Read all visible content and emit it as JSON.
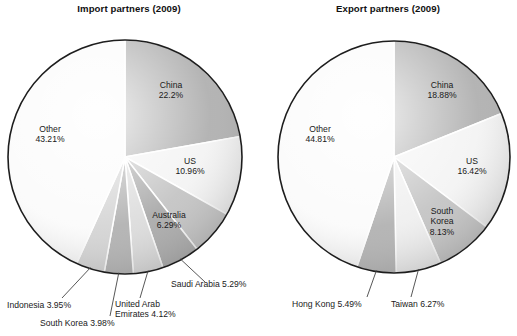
{
  "charts": [
    {
      "title": "Import partners (2009)",
      "center": {
        "x": 125,
        "y": 157
      },
      "radius": 117
    },
    {
      "title": "Export partners (2009)",
      "center": {
        "x": 135,
        "y": 157
      },
      "radius": 116
    }
  ],
  "chart_data": [
    {
      "type": "pie",
      "title": "Import partners (2009)",
      "xlabel": "",
      "ylabel": "",
      "legend": "none",
      "grid": false,
      "start_angle_deg": 0,
      "direction": "clockwise",
      "categories": [
        "China",
        "US",
        "Australia",
        "Saudi Arabia",
        "United Arab Emirates",
        "South Korea",
        "Indonesia",
        "Other"
      ],
      "values": [
        22.2,
        10.96,
        6.29,
        5.29,
        4.12,
        3.98,
        3.95,
        43.21
      ],
      "value_labels": [
        "22.2%",
        "10.96%",
        "6.29%",
        "5.29%",
        "4.12%",
        "3.98%",
        "3.95%",
        "43.21%"
      ],
      "slice_colors": [
        "#a6a6a6",
        "#f2f2f2",
        "#bdbdbd",
        "#a0a0a0",
        "#d8d8d8",
        "#a8a8a8",
        "#cfcfcf",
        "#fafafa"
      ],
      "labels_inside": [
        {
          "name": "China",
          "text": "China\n22.2%"
        },
        {
          "name": "US",
          "text": "US\n10.96%"
        },
        {
          "name": "Australia",
          "text": "Australia\n6.29%"
        },
        {
          "name": "Other",
          "text": "Other\n43.21%"
        }
      ],
      "labels_outside": [
        {
          "name": "Saudi Arabia",
          "text": "Saudi Arabia 5.29%"
        },
        {
          "name": "United Arab Emirates",
          "text": "United Arab\nEmirates 4.12%"
        },
        {
          "name": "South Korea",
          "text": "South Korea 3.98%"
        },
        {
          "name": "Indonesia",
          "text": "Indonesia 3.95%"
        }
      ]
    },
    {
      "type": "pie",
      "title": "Export partners (2009)",
      "xlabel": "",
      "ylabel": "",
      "legend": "none",
      "grid": false,
      "start_angle_deg": 0,
      "direction": "clockwise",
      "categories": [
        "China",
        "US",
        "South Korea",
        "Taiwan",
        "Hong Kong",
        "Other"
      ],
      "values": [
        18.88,
        16.42,
        8.13,
        6.27,
        5.49,
        44.81
      ],
      "value_labels": [
        "18.88%",
        "16.42%",
        "8.13%",
        "6.27%",
        "5.49%",
        "44.81%"
      ],
      "slice_colors": [
        "#a6a6a6",
        "#f2f2f2",
        "#bdbdbd",
        "#ededed",
        "#a8a8a8",
        "#fafafa"
      ],
      "labels_inside": [
        {
          "name": "China",
          "text": "China\n18.88%"
        },
        {
          "name": "US",
          "text": "US\n16.42%"
        },
        {
          "name": "South Korea",
          "text": "South\nKorea\n8.13%"
        },
        {
          "name": "Other",
          "text": "Other\n44.81%"
        }
      ],
      "labels_outside": [
        {
          "name": "Taiwan",
          "text": "Taiwan 6.27%"
        },
        {
          "name": "Hong Kong",
          "text": "Hong Kong 5.49%"
        }
      ]
    }
  ],
  "import_labels": {
    "china": "China\n22.2%",
    "us": "US\n10.96%",
    "australia": "Australia\n6.29%",
    "other": "Other\n43.21%",
    "saudi_arabia": "Saudi Arabia 5.29%",
    "uae": "United Arab\nEmirates 4.12%",
    "south_korea": "South Korea 3.98%",
    "indonesia": "Indonesia 3.95%"
  },
  "export_labels": {
    "china": "China\n18.88%",
    "us": "US\n16.42%",
    "south_korea": "South\nKorea\n8.13%",
    "other": "Other\n44.81%",
    "taiwan": "Taiwan 6.27%",
    "hong_kong": "Hong Kong 5.49%"
  }
}
